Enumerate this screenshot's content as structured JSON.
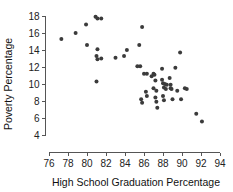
{
  "chart_data": {
    "type": "scatter",
    "title": "",
    "xlabel": "High School Graduation Percentage",
    "ylabel": "Poverty Percentage",
    "xlim": [
      75.2,
      94.6
    ],
    "ylim": [
      3.4,
      18.4
    ],
    "xticks": [
      76,
      78,
      80,
      82,
      84,
      86,
      88,
      90,
      92,
      94
    ],
    "yticks": [
      4,
      6,
      8,
      10,
      12,
      14,
      16,
      18
    ],
    "xtick_labels": [
      "76",
      "78",
      "80",
      "82",
      "84",
      "86",
      "88",
      "90",
      "92",
      "94"
    ],
    "ytick_labels": [
      "4",
      "6",
      "8",
      "10",
      "12",
      "14",
      "16",
      "18"
    ],
    "grid": false,
    "legend": false,
    "marker_color": "#3b3b3b",
    "marker_size": 2.0,
    "points": [
      [
        77.3,
        15.3
      ],
      [
        78.8,
        16.0
      ],
      [
        79.9,
        17.0
      ],
      [
        80.0,
        14.6
      ],
      [
        80.9,
        17.9
      ],
      [
        81.1,
        17.7
      ],
      [
        81.5,
        17.7
      ],
      [
        81.1,
        14.1
      ],
      [
        81.0,
        13.3
      ],
      [
        81.1,
        12.9
      ],
      [
        81.5,
        13.0
      ],
      [
        81.0,
        10.3
      ],
      [
        83.0,
        13.1
      ],
      [
        83.9,
        13.3
      ],
      [
        84.2,
        14.0
      ],
      [
        85.3,
        12.1
      ],
      [
        85.6,
        12.1
      ],
      [
        85.5,
        14.6
      ],
      [
        85.8,
        16.7
      ],
      [
        85.7,
        8.2
      ],
      [
        85.8,
        7.8
      ],
      [
        86.0,
        11.2
      ],
      [
        86.3,
        11.2
      ],
      [
        86.2,
        9.1
      ],
      [
        86.3,
        8.6
      ],
      [
        86.8,
        10.9
      ],
      [
        87.0,
        11.2
      ],
      [
        87.1,
        11.1
      ],
      [
        87.2,
        10.4
      ],
      [
        87.0,
        9.5
      ],
      [
        87.3,
        9.2
      ],
      [
        87.2,
        8.4
      ],
      [
        87.3,
        7.9
      ],
      [
        87.4,
        7.2
      ],
      [
        87.9,
        11.8
      ],
      [
        87.9,
        10.5
      ],
      [
        88.0,
        10.1
      ],
      [
        88.2,
        10.0
      ],
      [
        88.1,
        9.6
      ],
      [
        88.3,
        9.4
      ],
      [
        88.4,
        9.9
      ],
      [
        88.0,
        8.6
      ],
      [
        88.1,
        8.1
      ],
      [
        88.7,
        10.7
      ],
      [
        88.8,
        9.9
      ],
      [
        88.9,
        9.4
      ],
      [
        88.8,
        9.5
      ],
      [
        89.0,
        8.2
      ],
      [
        89.3,
        11.9
      ],
      [
        89.5,
        9.2
      ],
      [
        89.8,
        13.7
      ],
      [
        89.9,
        8.2
      ],
      [
        90.3,
        9.5
      ],
      [
        90.5,
        9.4
      ],
      [
        91.5,
        6.5
      ],
      [
        92.1,
        5.6
      ]
    ]
  }
}
